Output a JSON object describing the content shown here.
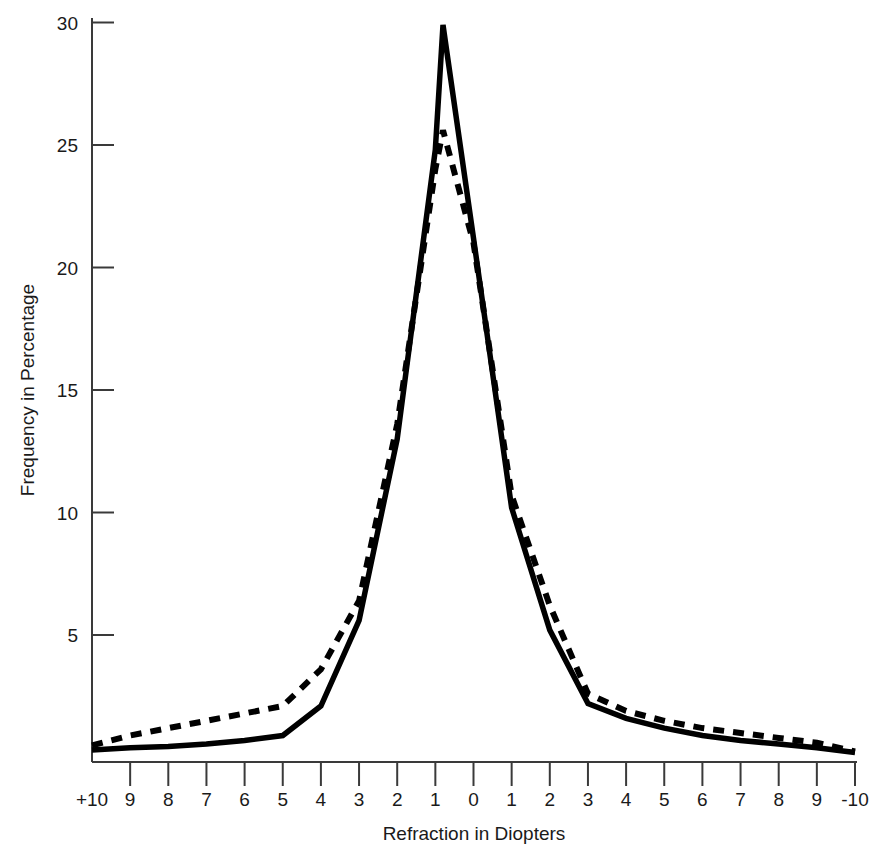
{
  "chart_data": {
    "type": "line",
    "title": "",
    "subtitle": "",
    "xlabel": "Refraction in Diopters",
    "ylabel": "Frequency in Percentage",
    "grid": false,
    "legend": "none",
    "xtick_labels": [
      "+10",
      "9",
      "8",
      "7",
      "6",
      "5",
      "4",
      "3",
      "2",
      "1",
      "0",
      "1",
      "2",
      "3",
      "4",
      "5",
      "6",
      "7",
      "8",
      "9",
      "-10"
    ],
    "x": [
      10,
      9,
      8,
      7,
      6,
      5,
      4,
      3,
      2,
      1,
      0,
      -1,
      -2,
      -3,
      -4,
      -5,
      -6,
      -7,
      -8,
      -9,
      -10
    ],
    "ytick_labels": [
      "5",
      "10",
      "15",
      "20",
      "25",
      "30"
    ],
    "yticks": [
      5,
      10,
      15,
      20,
      25,
      30
    ],
    "xlim": [
      10,
      -10
    ],
    "ylim": [
      0,
      31
    ],
    "series": [
      {
        "name": "solid",
        "style": "solid",
        "color": "#000000",
        "values": [
          0.3,
          0.4,
          0.45,
          0.55,
          0.7,
          0.9,
          2.1,
          5.6,
          13.0,
          24.8,
          21.2,
          10.2,
          5.2,
          2.2,
          1.6,
          1.2,
          0.9,
          0.7,
          0.55,
          0.4,
          0.2
        ]
      },
      {
        "name": "dashed",
        "style": "dashed",
        "color": "#000000",
        "values": [
          0.5,
          0.9,
          1.2,
          1.5,
          1.8,
          2.1,
          3.6,
          6.4,
          13.6,
          24.0,
          21.0,
          10.7,
          6.2,
          2.6,
          1.9,
          1.5,
          1.2,
          1.0,
          0.8,
          0.6,
          0.25
        ]
      }
    ],
    "peaks": {
      "solid_peak_value": 29.9,
      "solid_peak_x": 0.8,
      "dashed_peak_value": 25.6,
      "dashed_peak_x": 0.8
    }
  }
}
